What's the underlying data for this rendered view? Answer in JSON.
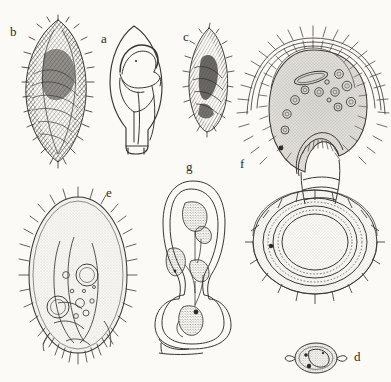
{
  "figure": {
    "type": "scientific-illustration-plate",
    "medium": "pen-and-ink line drawing with stipple and hatching",
    "background_color": "#fbfaf6",
    "ink_color": "#3a3733",
    "panel_count": 7
  },
  "panels": [
    {
      "id": "b",
      "label": "b",
      "label_x": 14,
      "label_y": 35,
      "description": "elongate ovoid cell densely covered in ciliary hatching, dark cross-hatched interior bands",
      "style": "dense-hatched"
    },
    {
      "id": "a",
      "label": "a",
      "label_x": 105,
      "label_y": 42,
      "description": "outline drawing of conical teardrop body with internal spiral lip and short basal stalk",
      "style": "clean-outline"
    },
    {
      "id": "c",
      "label": "c",
      "label_x": 187,
      "label_y": 40,
      "description": "small lanceolate ciliated cell with dark internal macronucleus band",
      "style": "dense-hatched"
    },
    {
      "id": "f",
      "label": "f",
      "label_x": 243,
      "label_y": 168,
      "description": "large stippled bell-shaped zooid with ciliary corona, contractile stalk and concentric scalloped attachment disc",
      "style": "stippled-with-corona"
    },
    {
      "id": "e",
      "label": "e",
      "label_x": 110,
      "label_y": 196,
      "description": "broad ovoid ciliate, uniformly stippled cytoplasm, two contractile vacuoles and granule field, marginal cilia all around",
      "style": "stippled-ciliate"
    },
    {
      "id": "g",
      "label": "g",
      "label_x": 190,
      "label_y": 170,
      "description": "outline section of contracted zooid showing stippled nuclear lobes and basal disc in profile",
      "style": "outline-with-stippled-lobes"
    },
    {
      "id": "d",
      "label": "d",
      "label_x": 358,
      "label_y": 360,
      "description": "small lens-shaped cyst with pointed lateral ends and granular contents",
      "style": "small-cyst"
    }
  ]
}
